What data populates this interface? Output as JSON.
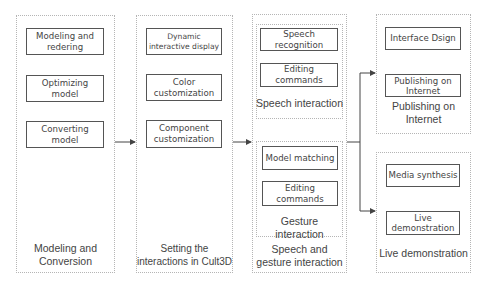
{
  "diagram": {
    "stages": [
      {
        "id": "modeling",
        "label": "Modeling and Conversion",
        "label_lines": [
          "Modeling and",
          "Conversion"
        ],
        "steps": [
          {
            "lines": [
              "Modeling and",
              "redering"
            ]
          },
          {
            "lines": [
              "Optimizing",
              "model"
            ]
          },
          {
            "lines": [
              "Converting",
              "model"
            ]
          }
        ]
      },
      {
        "id": "interactions",
        "label": "Setting the interactions in Cult3D",
        "label_lines": [
          "Setting the",
          "interactions in Cult3D"
        ],
        "steps": [
          {
            "lines": [
              "Dynamic",
              "interactive display"
            ]
          },
          {
            "lines": [
              "Color",
              "customization"
            ]
          },
          {
            "lines": [
              "Component",
              "customization"
            ]
          }
        ]
      },
      {
        "id": "speech-gesture",
        "label": "Speech and gesture interaction",
        "label_lines": [
          "Speech and",
          "gesture interaction"
        ],
        "groups": [
          {
            "id": "speech",
            "label": "Speech interaction",
            "steps": [
              {
                "lines": [
                  "Speech",
                  "recognition"
                ]
              },
              {
                "lines": [
                  "Editing",
                  "commands"
                ]
              }
            ]
          },
          {
            "id": "gesture",
            "label": "Gesture interaction",
            "steps": [
              {
                "lines": [
                  "Model matching"
                ]
              },
              {
                "lines": [
                  "Editing",
                  "commands"
                ]
              }
            ]
          }
        ]
      },
      {
        "id": "publishing",
        "label": "Publishing on Internet",
        "label_lines": [
          "Publishing on",
          "Internet"
        ],
        "steps": [
          {
            "lines": [
              "Interface Dsign"
            ]
          },
          {
            "lines": [
              "Publishing on",
              "Internet"
            ]
          }
        ]
      },
      {
        "id": "live",
        "label": "Live demonstration",
        "label_lines": [
          "Live demonstration"
        ],
        "steps": [
          {
            "lines": [
              "Media synthesis"
            ]
          },
          {
            "lines": [
              "Live",
              "demonstration"
            ]
          }
        ]
      }
    ],
    "flow": [
      "Modeling and Conversion",
      "Setting the interactions in Cult3D",
      "Speech and gesture interaction",
      [
        "Publishing on Internet",
        "Live demonstration"
      ]
    ],
    "colors": {
      "box_border": "#555555",
      "panel_border": "#b5b5b5",
      "text": "#444444",
      "arrow": "#444444"
    }
  }
}
